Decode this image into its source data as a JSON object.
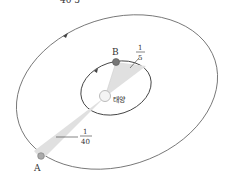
{
  "diagram": {
    "title_fragment": "40   5",
    "sun": {
      "label": "태양",
      "color": "#f2f2f2"
    },
    "planet_a": {
      "label": "A",
      "color": "#999999"
    },
    "planet_b": {
      "label": "B",
      "color": "#777777"
    },
    "fraction_a": {
      "numerator": "1",
      "denominator": "40"
    },
    "fraction_b": {
      "numerator": "1",
      "denominator": "5"
    },
    "colors": {
      "orbit": "#666666",
      "sector": "#e0e0e0",
      "text": "#333333"
    }
  }
}
